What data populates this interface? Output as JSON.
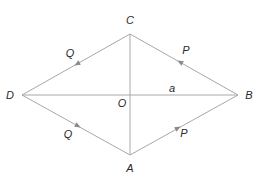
{
  "diagram": {
    "type": "rhombus-vectors",
    "vertices": [
      {
        "name": "C",
        "x": 130,
        "y": 34,
        "label_x": 130,
        "label_y": 23
      },
      {
        "name": "D",
        "x": 22,
        "y": 95,
        "label_x": 10,
        "label_y": 99
      },
      {
        "name": "B",
        "x": 238,
        "y": 95,
        "label_x": 249,
        "label_y": 99
      },
      {
        "name": "A",
        "x": 130,
        "y": 155,
        "label_x": 130,
        "label_y": 172
      }
    ],
    "center": {
      "name": "O",
      "label": "O"
    },
    "diagonal_label": "a",
    "edges": [
      {
        "from": "C",
        "to": "D",
        "vector": "Q"
      },
      {
        "from": "D",
        "to": "A",
        "vector": "Q"
      },
      {
        "from": "B",
        "to": "C",
        "vector": "P"
      },
      {
        "from": "A",
        "to": "B",
        "vector": "P"
      }
    ],
    "labels": {
      "C": "C",
      "D": "D",
      "B": "B",
      "A": "A",
      "O": "O",
      "a": "a",
      "Q_upper": "Q",
      "Q_lower": "Q",
      "P_upper": "P",
      "P_lower": "P"
    },
    "colors": {
      "line": "#a8a8a8",
      "arrow": "#8a8a8a",
      "text": "#2a2a2a"
    }
  }
}
